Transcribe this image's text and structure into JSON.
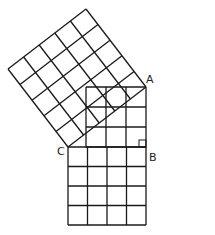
{
  "diagram": {
    "labels": {
      "A": "A",
      "B": "B",
      "C": "C"
    },
    "stroke_color": "#1a1a1a",
    "vertices": {
      "A": [
        146,
        87
      ],
      "B": [
        146,
        147
      ],
      "C": [
        68,
        147
      ]
    },
    "squares": [
      {
        "name": "square-on-AB",
        "side": 3,
        "cells": 9
      },
      {
        "name": "square-on-CB",
        "side": 4,
        "cells": 16
      },
      {
        "name": "square-on-CA",
        "side": 5,
        "cells": 25
      }
    ],
    "right_angle_at": "B"
  }
}
